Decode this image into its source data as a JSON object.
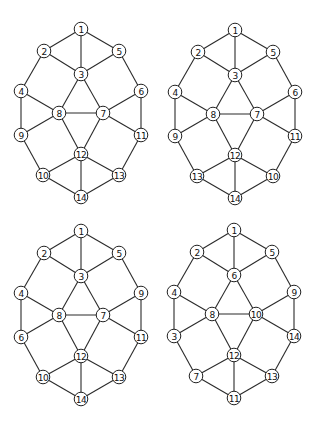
{
  "figure": {
    "node_count": 14,
    "edges_by_slot": [
      [
        "top",
        "upper-left"
      ],
      [
        "top",
        "center-top"
      ],
      [
        "top",
        "upper-right"
      ],
      [
        "upper-left",
        "center-top"
      ],
      [
        "center-top",
        "upper-right"
      ],
      [
        "upper-left",
        "mid-left"
      ],
      [
        "upper-right",
        "mid-right"
      ],
      [
        "center-top",
        "center-left"
      ],
      [
        "center-top",
        "center-right"
      ],
      [
        "mid-left",
        "center-left"
      ],
      [
        "mid-right",
        "center-right"
      ],
      [
        "center-left",
        "center-right"
      ],
      [
        "mid-left",
        "low-left"
      ],
      [
        "mid-right",
        "low-right"
      ],
      [
        "center-left",
        "low-left"
      ],
      [
        "center-right",
        "low-right"
      ],
      [
        "center-left",
        "center-bottom"
      ],
      [
        "center-right",
        "center-bottom"
      ],
      [
        "low-left",
        "lower-left"
      ],
      [
        "low-right",
        "lower-right"
      ],
      [
        "center-bottom",
        "lower-left"
      ],
      [
        "center-bottom",
        "lower-right"
      ],
      [
        "center-bottom",
        "bottom"
      ],
      [
        "lower-left",
        "bottom"
      ],
      [
        "lower-right",
        "bottom"
      ]
    ],
    "graphs": [
      {
        "name": "graph-top-left",
        "labels": {
          "top": "1",
          "upper-left": "2",
          "upper-right": "5",
          "center-top": "3",
          "mid-left": "4",
          "mid-right": "6",
          "center-left": "8",
          "center-right": "7",
          "low-left": "9",
          "low-right": "11",
          "center-bottom": "12",
          "lower-left": "10",
          "lower-right": "13",
          "bottom": "14"
        }
      },
      {
        "name": "graph-top-right",
        "labels": {
          "top": "1",
          "upper-left": "2",
          "upper-right": "5",
          "center-top": "3",
          "mid-left": "4",
          "mid-right": "6",
          "center-left": "8",
          "center-right": "7",
          "low-left": "9",
          "low-right": "11",
          "center-bottom": "12",
          "lower-left": "13",
          "lower-right": "10",
          "bottom": "14"
        }
      },
      {
        "name": "graph-bottom-left",
        "labels": {
          "top": "1",
          "upper-left": "2",
          "upper-right": "5",
          "center-top": "3",
          "mid-left": "4",
          "mid-right": "9",
          "center-left": "8",
          "center-right": "7",
          "low-left": "6",
          "low-right": "11",
          "center-bottom": "12",
          "lower-left": "10",
          "lower-right": "13",
          "bottom": "14"
        }
      },
      {
        "name": "graph-bottom-right",
        "labels": {
          "top": "1",
          "upper-left": "2",
          "upper-right": "5",
          "center-top": "6",
          "mid-left": "4",
          "mid-right": "9",
          "center-left": "8",
          "center-right": "10",
          "low-left": "3",
          "low-right": "14",
          "center-bottom": "12",
          "lower-left": "7",
          "lower-right": "13",
          "bottom": "11"
        }
      }
    ]
  }
}
